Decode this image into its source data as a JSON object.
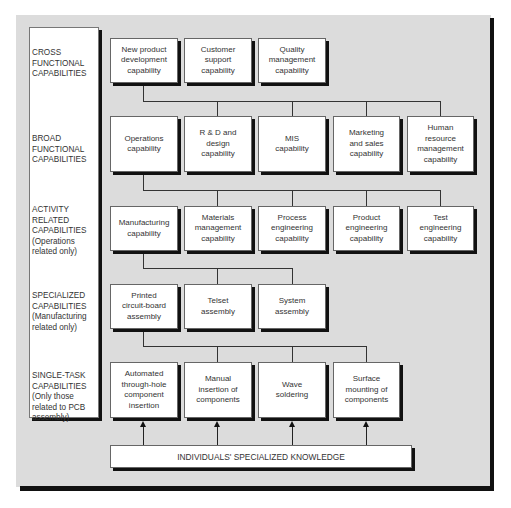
{
  "levels": [
    {
      "label": "CROSS\nFUNCTIONAL\nCAPABILITIES"
    },
    {
      "label": "BROAD\nFUNCTIONAL\nCAPABILITIES"
    },
    {
      "label": "ACTIVITY\nRELATED\nCAPABILITIES\n(Operations\nrelated only)"
    },
    {
      "label": "SPECIALIZED\nCAPABILITIES\n(Manufacturing\nrelated only)"
    },
    {
      "label": "SINGLE-TASK\nCAPABILITIES\n(Only those\nrelated to PCB\nassembly)"
    }
  ],
  "rows": [
    {
      "boxes": [
        "New product\ndevelopment\ncapability",
        "Customer\nsupport\ncapability",
        "Quality\nmanagement\ncapability"
      ]
    },
    {
      "boxes": [
        "Operations\ncapability",
        "R & D and\ndesign\ncapability",
        "MIS\ncapability",
        "Marketing\nand sales\ncapability",
        "Human\nresource\nmanagement\ncapability"
      ]
    },
    {
      "boxes": [
        "Manufacturing\ncapability",
        "Materials\nmanagement\ncapability",
        "Process\nengineering\ncapability",
        "Product\nengineering\ncapability",
        "Test\nengineering\ncapability"
      ]
    },
    {
      "boxes": [
        "Printed\ncircuit-board\nassembly",
        "Telset\nassembly",
        "System\nassembly"
      ]
    },
    {
      "boxes": [
        "Automated\nthrough-hole\ncomponent\ninsertion",
        "Manual\ninsertion of\ncomponents",
        "Wave\nsoldering",
        "Surface\nmounting of\ncomponents"
      ]
    }
  ],
  "foundation": {
    "label": "INDIVIDUALS' SPECIALIZED KNOWLEDGE"
  },
  "colors": {
    "panel": "#dcdcdc",
    "box": "#ffffff",
    "shadow": "#111111"
  }
}
